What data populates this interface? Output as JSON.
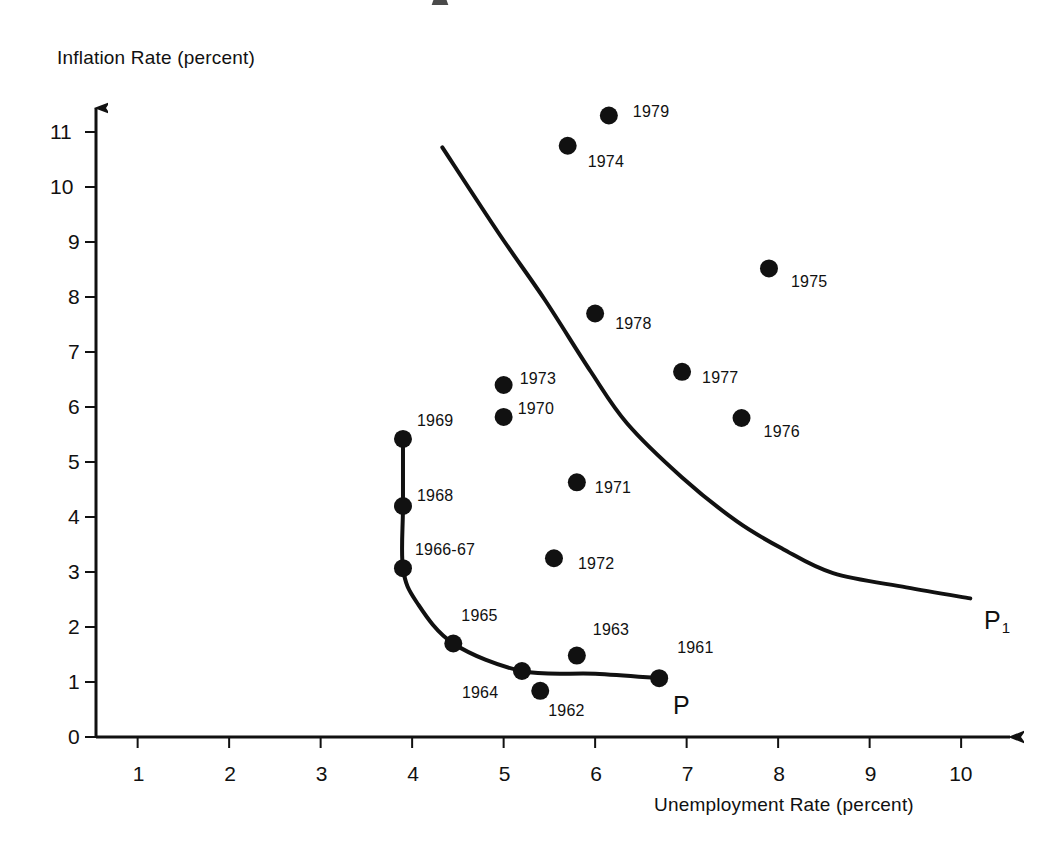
{
  "chart_data": {
    "type": "scatter",
    "title": "",
    "xlabel": "Unemployment Rate (percent)",
    "ylabel": "Inflation Rate (percent)",
    "xlim": [
      0,
      10.7
    ],
    "ylim": [
      0,
      11.8
    ],
    "xticks": [
      "1",
      "2",
      "3",
      "4",
      "5",
      "6",
      "7",
      "8",
      "9",
      "10"
    ],
    "yticks": [
      "0",
      "1",
      "2",
      "3",
      "4",
      "5",
      "6",
      "7",
      "8",
      "9",
      "10",
      "11"
    ],
    "grid": false,
    "legend": "none",
    "series": [
      {
        "name": "Annual observations",
        "points": [
          {
            "label": "1961",
            "x": 6.7,
            "y": 1.07
          },
          {
            "label": "1962",
            "x": 5.4,
            "y": 0.84
          },
          {
            "label": "1963",
            "x": 5.8,
            "y": 1.48
          },
          {
            "label": "1964",
            "x": 5.2,
            "y": 1.2
          },
          {
            "label": "1965",
            "x": 4.45,
            "y": 1.7
          },
          {
            "label": "1966-67",
            "x": 3.9,
            "y": 3.07
          },
          {
            "label": "1968",
            "x": 3.9,
            "y": 4.2
          },
          {
            "label": "1969",
            "x": 3.9,
            "y": 5.42
          },
          {
            "label": "1970",
            "x": 5.0,
            "y": 5.82
          },
          {
            "label": "1971",
            "x": 5.8,
            "y": 4.63
          },
          {
            "label": "1972",
            "x": 5.55,
            "y": 3.25
          },
          {
            "label": "1973",
            "x": 5.0,
            "y": 6.4
          },
          {
            "label": "1974",
            "x": 5.7,
            "y": 10.75
          },
          {
            "label": "1975",
            "x": 7.9,
            "y": 8.52
          },
          {
            "label": "1976",
            "x": 7.6,
            "y": 5.8
          },
          {
            "label": "1977",
            "x": 6.95,
            "y": 6.64
          },
          {
            "label": "1978",
            "x": 6.0,
            "y": 7.7
          },
          {
            "label": "1979",
            "x": 6.15,
            "y": 11.3
          }
        ]
      }
    ],
    "curves": [
      {
        "name": "P",
        "label": "P",
        "label_x": 6.85,
        "label_y": 0.55,
        "path": [
          {
            "x": 3.9,
            "y": 5.42
          },
          {
            "x": 3.9,
            "y": 4.2
          },
          {
            "x": 3.9,
            "y": 3.07
          },
          {
            "x": 4.05,
            "y": 2.45
          },
          {
            "x": 4.45,
            "y": 1.7
          },
          {
            "x": 5.2,
            "y": 1.2
          },
          {
            "x": 6.0,
            "y": 1.15
          },
          {
            "x": 6.7,
            "y": 1.07
          }
        ]
      },
      {
        "name": "P1",
        "label": "P",
        "label_sub": "1",
        "label_x": 10.25,
        "label_y": 2.1,
        "path": [
          {
            "x": 4.33,
            "y": 10.72
          },
          {
            "x": 4.95,
            "y": 9.15
          },
          {
            "x": 5.45,
            "y": 7.95
          },
          {
            "x": 5.95,
            "y": 6.65
          },
          {
            "x": 6.35,
            "y": 5.7
          },
          {
            "x": 6.95,
            "y": 4.72
          },
          {
            "x": 7.55,
            "y": 3.92
          },
          {
            "x": 8.05,
            "y": 3.42
          },
          {
            "x": 8.6,
            "y": 2.98
          },
          {
            "x": 9.4,
            "y": 2.72
          },
          {
            "x": 10.1,
            "y": 2.52
          }
        ]
      }
    ]
  },
  "axes": {
    "y_axis_title": "Inflation Rate (percent)",
    "x_axis_title": "Unemployment Rate (percent)"
  }
}
